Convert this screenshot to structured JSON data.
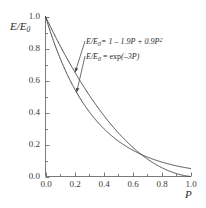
{
  "chart_data": {
    "type": "line",
    "title": "",
    "subtitle": "",
    "xlabel": "P",
    "ylabel": "E/E0",
    "ylabel_parts": {
      "main": "E/E",
      "sub": "0"
    },
    "xlim": [
      0.0,
      1.0
    ],
    "ylim": [
      0.0,
      1.0
    ],
    "grid": false,
    "legend_position": "inside-annotations",
    "xticks": [
      "0.0",
      "0.2",
      "0.4",
      "0.6",
      "0.8",
      "1.0"
    ],
    "xtick_values": [
      0.0,
      0.2,
      0.4,
      0.6,
      0.8,
      1.0
    ],
    "yticks": [
      "0.0",
      "0.2",
      "0.4",
      "0.6",
      "0.8",
      "1.0"
    ],
    "ytick_values": [
      0.0,
      0.2,
      0.4,
      0.6,
      0.8,
      1.0
    ],
    "minor_ticks": true,
    "x": [
      0.0,
      0.05,
      0.1,
      0.15,
      0.2,
      0.25,
      0.3,
      0.35,
      0.4,
      0.45,
      0.5,
      0.55,
      0.6,
      0.65,
      0.7,
      0.75,
      0.8,
      0.85,
      0.9,
      0.95,
      1.0
    ],
    "series": [
      {
        "name": "E/E0 = 1 - 1.9P + 0.9P^2",
        "formula": "quadratic",
        "coeffs": {
          "a": 0.9,
          "b": -1.9,
          "c": 1.0
        },
        "values": [
          1.0,
          0.9073,
          0.819,
          0.7353,
          0.656,
          0.5813,
          0.511,
          0.4453,
          0.384,
          0.3273,
          0.275,
          0.2273,
          0.184,
          0.1453,
          0.111,
          0.0813,
          0.056,
          0.0353,
          0.019,
          0.0073,
          0.0
        ]
      },
      {
        "name": "E/E0 = exp(-3P)",
        "formula": "exponential",
        "coeffs": {
          "k": -3.0
        },
        "values": [
          1.0,
          0.8607,
          0.7408,
          0.6376,
          0.5488,
          0.4724,
          0.4066,
          0.3499,
          0.3012,
          0.2592,
          0.2231,
          0.192,
          0.1653,
          0.1423,
          0.1225,
          0.1054,
          0.0907,
          0.0781,
          0.0672,
          0.0578,
          0.0498
        ]
      }
    ],
    "annotations": [
      {
        "id": "annotation-quadratic",
        "text": "E/E0 = 1 - 1.9P + 0.9P^2",
        "parts": {
          "lhs_main": "E/E",
          "lhs_sub": "0",
          "rhs": "= 1 – 1.9P + 0.9P",
          "rhs_sup": "2"
        },
        "target_x": 0.205,
        "target_y": 0.652,
        "arrow": true
      },
      {
        "id": "annotation-exponential",
        "text": "E/E0 = exp(-3P)",
        "parts": {
          "lhs_main": "E/E",
          "lhs_sub": "0",
          "rhs_fn": "exp",
          "rhs_arg": "(–3P)"
        },
        "target_x": 0.215,
        "target_y": 0.527,
        "arrow": true
      }
    ],
    "colors": {
      "curve": "#4a4a4a",
      "axis": "#6b6b6b",
      "text": "#2b2b2b",
      "background": "#ffffff"
    }
  }
}
